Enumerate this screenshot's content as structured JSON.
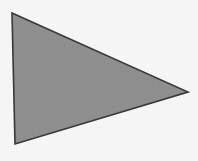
{
  "canvas": {
    "width": 198,
    "height": 161,
    "background_color": "#f6f6f6",
    "caption": ""
  },
  "shape": {
    "name": "triangle",
    "kind": "polygon",
    "sides": 3,
    "fill_color": "#8f8f8f",
    "stroke_color": "#383838",
    "stroke_width": 1.6,
    "points": "12,13 188,92 15,144",
    "vertices": [
      {
        "label": "top-left",
        "x": 12,
        "y": 13
      },
      {
        "label": "right",
        "x": 188,
        "y": 92
      },
      {
        "label": "bottom-left",
        "x": 15,
        "y": 144
      }
    ]
  }
}
